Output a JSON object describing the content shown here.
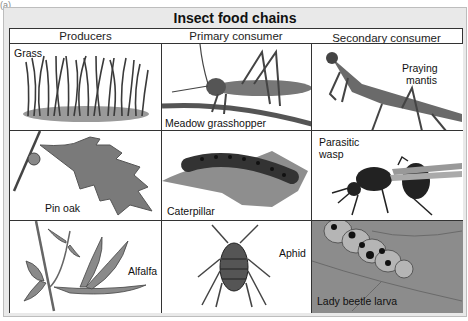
{
  "panel_label": "(a)",
  "title": "Insect food chains",
  "columns": [
    "Producers",
    "Primary consumer",
    "Secondary consumer"
  ],
  "rows": [
    {
      "producer": "Grass",
      "primary": "Meadow grasshopper",
      "secondary": "Praying mantis"
    },
    {
      "producer": "Pin oak",
      "primary": "Caterpillar",
      "secondary": "Parasitic wasp"
    },
    {
      "producer": "Alfalfa",
      "primary": "Aphid",
      "secondary": "Lady beetle larva"
    }
  ],
  "secondary_labels": {
    "mantis_line1": "Praying",
    "mantis_line2": "mantis",
    "wasp_line1": "Parasitic",
    "wasp_line2": "wasp"
  }
}
